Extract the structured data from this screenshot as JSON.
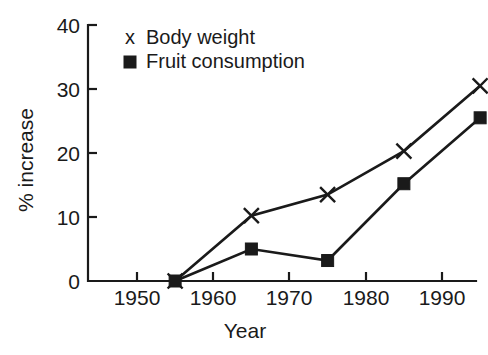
{
  "chart_data": {
    "type": "line",
    "title": "",
    "xlabel": "Year",
    "ylabel": "% increase",
    "x": [
      1955,
      1965,
      1975,
      1985,
      1995
    ],
    "xlim": [
      1950,
      1997
    ],
    "ylim": [
      0,
      40
    ],
    "xticks": [
      1950,
      1960,
      1970,
      1980,
      1990
    ],
    "xtick_labels": [
      "1950",
      "1960",
      "1970",
      "1980",
      "1990"
    ],
    "yticks": [
      0,
      10,
      20,
      30,
      40
    ],
    "ytick_labels": [
      "0",
      "10",
      "20",
      "30",
      "40"
    ],
    "grid": false,
    "legend_position": "upper-left-inside",
    "series": [
      {
        "name": "Body weight",
        "marker": "x",
        "values": [
          0,
          10.2,
          13.5,
          20.3,
          30.5
        ]
      },
      {
        "name": "Fruit consumption",
        "marker": "square",
        "values": [
          0,
          5.0,
          3.2,
          15.2,
          25.5
        ]
      }
    ],
    "colors": {
      "line": "#1a1a1a",
      "axis": "#1a1a1a",
      "background": "#ffffff",
      "text": "#1a1a1a"
    }
  },
  "legend": {
    "entries": [
      {
        "marker_glyph": "x",
        "label": "Body weight"
      },
      {
        "marker_glyph": "■",
        "label": "Fruit consumption"
      }
    ]
  },
  "axes": {
    "y_title": "% increase",
    "x_title": "Year",
    "y_labels": [
      "40",
      "30",
      "20",
      "10",
      "0"
    ],
    "x_labels": [
      "1950",
      "1960",
      "1970",
      "1980",
      "1990"
    ]
  }
}
